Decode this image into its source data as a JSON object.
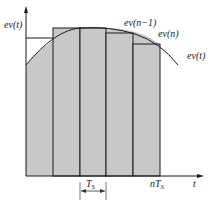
{
  "diagram": {
    "y_axis_label": "ev(t)",
    "x_axis_label": "t",
    "curve_label": "ev(t)",
    "step_labels": [
      "ev(n−1)",
      "ev(n)"
    ],
    "period_label": "T",
    "period_sub": "S",
    "end_label": "nT",
    "end_sub": "S",
    "colors": {
      "fill": "#c8c8c8",
      "line": "#1a1a1a",
      "background": "#ffffff"
    }
  }
}
